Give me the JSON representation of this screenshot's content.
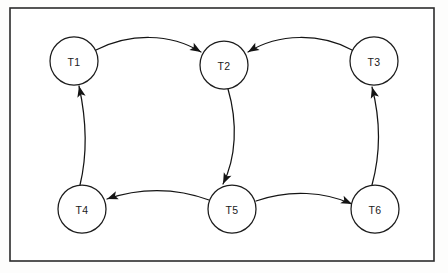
{
  "diagram": {
    "frame": {
      "x": 10,
      "y": 8,
      "width": 424,
      "height": 253,
      "stroke_color": "#2b2b2b"
    },
    "node_style": {
      "radius": 24,
      "fill_color": "#ffffff",
      "stroke_color": "#1c1c1c"
    },
    "edge_style": {
      "stroke_color": "#141414",
      "arrow": "solid-triangle"
    },
    "nodes": [
      {
        "id": "T1",
        "label": "T1",
        "cx": 74,
        "cy": 61
      },
      {
        "id": "T2",
        "label": "T2",
        "cx": 224,
        "cy": 65
      },
      {
        "id": "T3",
        "label": "T3",
        "cx": 374,
        "cy": 61
      },
      {
        "id": "T4",
        "label": "T4",
        "cx": 82,
        "cy": 209
      },
      {
        "id": "T5",
        "label": "T5",
        "cx": 232,
        "cy": 209
      },
      {
        "id": "T6",
        "label": "T6",
        "cx": 375,
        "cy": 209
      }
    ],
    "edges": [
      {
        "id": "edge-t1-t2",
        "from": "T1",
        "to": "T2",
        "path": "M 96 50 C 130 33 170 33 201 52",
        "arrow": {
          "x": 201,
          "y": 52,
          "angle": 31
        }
      },
      {
        "id": "edge-t3-t2",
        "from": "T3",
        "to": "T2",
        "path": "M 352 50 C 320 33 279 33 248 52",
        "arrow": {
          "x": 248,
          "y": 52,
          "angle": 149
        }
      },
      {
        "id": "edge-t2-t5",
        "from": "T2",
        "to": "T5",
        "path": "M 228 89 C 238 123 236 158 223 184",
        "arrow": {
          "x": 223,
          "y": 184,
          "angle": 115
        }
      },
      {
        "id": "edge-t5-t4",
        "from": "T5",
        "to": "T4",
        "path": "M 209 200 C 175 187 138 188 107 199",
        "arrow": {
          "x": 107,
          "y": 199,
          "angle": 160
        }
      },
      {
        "id": "edge-t5-t6",
        "from": "T5",
        "to": "T6",
        "path": "M 256 201 C 290 189 325 192 352 204",
        "arrow": {
          "x": 352,
          "y": 204,
          "angle": 24
        }
      },
      {
        "id": "edge-t6-t3",
        "from": "T6",
        "to": "T3",
        "path": "M 372 185 C 381 152 380 118 372 87",
        "arrow": {
          "x": 372,
          "y": 87,
          "angle": -105
        }
      },
      {
        "id": "edge-t4-t1",
        "from": "T4",
        "to": "T1",
        "path": "M 80 185 C 88 152 86 118 79 86",
        "arrow": {
          "x": 79,
          "y": 86,
          "angle": -103
        }
      }
    ]
  }
}
